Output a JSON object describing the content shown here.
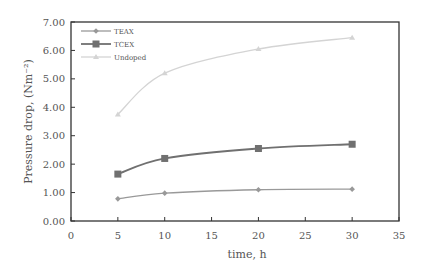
{
  "chart_data": {
    "type": "line",
    "title": "",
    "xlabel": "time, h",
    "ylabel": "Pressure drop, (Nm⁻²)",
    "xlim": [
      0,
      35
    ],
    "ylim": [
      0,
      7
    ],
    "xticks": [
      0,
      5,
      10,
      15,
      20,
      25,
      30,
      35
    ],
    "yticks": [
      0,
      1,
      2,
      3,
      4,
      5,
      6,
      7
    ],
    "ytick_labels": [
      "0.00",
      "1.00",
      "2.00",
      "3.00",
      "4.00",
      "5.00",
      "6.00",
      "7.00"
    ],
    "grid": false,
    "legend_position": "upper left",
    "x": [
      5,
      10,
      20,
      30
    ],
    "series": [
      {
        "name": "TEAX",
        "values": [
          0.78,
          0.98,
          1.1,
          1.12
        ],
        "color": "#999999",
        "marker": "diamond"
      },
      {
        "name": "TCEX",
        "values": [
          1.65,
          2.2,
          2.55,
          2.7
        ],
        "color": "#707070",
        "marker": "square"
      },
      {
        "name": "Undoped",
        "values": [
          3.75,
          5.2,
          6.05,
          6.45
        ],
        "color": "#d4d4d4",
        "marker": "triangle"
      }
    ]
  },
  "plot_area": {
    "left": 71,
    "top": 22,
    "right": 399,
    "bottom": 221
  }
}
